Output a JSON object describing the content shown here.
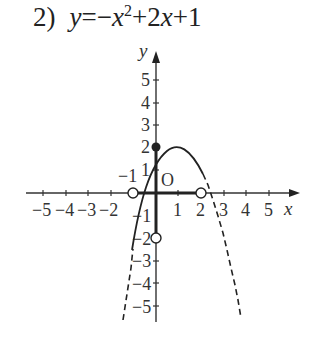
{
  "problem": {
    "number": "2)",
    "equation_lhs": "y",
    "equation_rhs": "=−x²+2x+1",
    "equation_parts": [
      "y",
      "=−",
      "x",
      "2",
      "+2",
      "x",
      "+1"
    ]
  },
  "graph": {
    "x_axis_label": "x",
    "y_axis_label": "y",
    "origin_label": "O",
    "x_ticks": [
      "−5",
      "−4",
      "−3",
      "−2",
      "−1",
      "1",
      "2",
      "3",
      "4",
      "5"
    ],
    "y_ticks": [
      "5",
      "4",
      "3",
      "2",
      "1",
      "−1",
      "−2",
      "−3",
      "−4",
      "−5"
    ],
    "function": "y = -x^2 + 2x + 1",
    "solid_domain": [
      -1,
      2
    ],
    "filled_points": [
      [
        0,
        2
      ]
    ],
    "open_points": [
      [
        -1,
        0
      ],
      [
        2,
        0
      ],
      [
        0,
        -2
      ]
    ],
    "bold_segments": [
      {
        "axis": "y",
        "from": [
          0,
          2
        ],
        "to": [
          0,
          -2
        ]
      },
      {
        "axis": "x",
        "from": [
          -1,
          0
        ],
        "to": [
          2,
          0
        ]
      }
    ],
    "colors": {
      "ink": "#222222",
      "background": "#ffffff"
    }
  }
}
